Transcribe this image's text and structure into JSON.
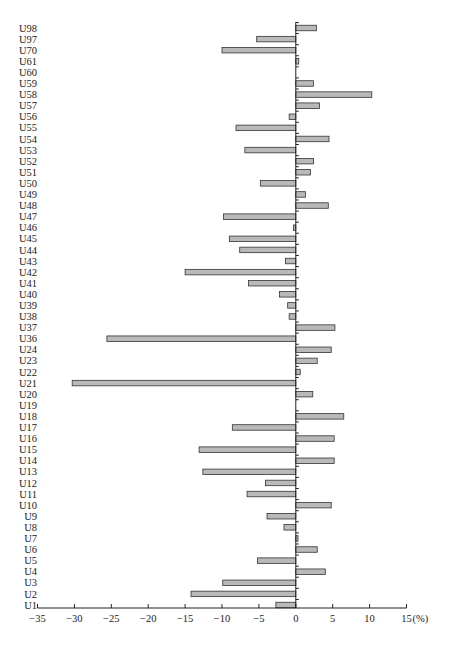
{
  "chart_data": {
    "type": "bar",
    "orientation": "horizontal",
    "title": "",
    "xlabel": "",
    "ylabel": "",
    "x_unit_label": "(%)",
    "xlim": [
      -35,
      15
    ],
    "x_ticks": [
      -35,
      -30,
      -25,
      -20,
      -15,
      -10,
      -5,
      0,
      5,
      10,
      15
    ],
    "x_tick_labels": [
      "−35",
      "−30",
      "−25",
      "−20",
      "−15",
      "−10",
      "−5",
      "0",
      "5",
      "10",
      "15"
    ],
    "grid": false,
    "legend": "none",
    "categories": [
      "U98",
      "U97",
      "U70",
      "U61",
      "U60",
      "U59",
      "U58",
      "U57",
      "U56",
      "U55",
      "U54",
      "U53",
      "U52",
      "U51",
      "U50",
      "U49",
      "U48",
      "U47",
      "U46",
      "U45",
      "U44",
      "U43",
      "U42",
      "U41",
      "U40",
      "U39",
      "U38",
      "U37",
      "U36",
      "U24",
      "U23",
      "U22",
      "U21",
      "U20",
      "U19",
      "U18",
      "U17",
      "U16",
      "U15",
      "U14",
      "U13",
      "U12",
      "U11",
      "U10",
      "U9",
      "U8",
      "U7",
      "U6",
      "U5",
      "U4",
      "U3",
      "U2",
      "U1"
    ],
    "values": [
      2.8,
      -5.3,
      -10.0,
      0.4,
      0,
      2.4,
      10.3,
      3.2,
      -0.9,
      -8.1,
      4.5,
      -6.9,
      2.4,
      2.0,
      -4.8,
      1.3,
      4.4,
      -9.8,
      -0.3,
      -9.0,
      -7.6,
      -1.4,
      -15.0,
      -6.4,
      -2.2,
      -1.1,
      -0.9,
      5.3,
      -25.6,
      4.8,
      2.9,
      0.6,
      -30.3,
      2.3,
      0,
      6.5,
      -8.6,
      5.2,
      -13.1,
      5.2,
      -12.6,
      -4.1,
      -6.6,
      4.8,
      -3.9,
      -1.6,
      0.3,
      2.9,
      -5.2,
      4.0,
      -9.9,
      -14.2,
      -2.7
    ],
    "colors": {
      "bar_fill": "#b9b9b9",
      "bar_stroke": "#333333",
      "axis": "#222222"
    }
  }
}
